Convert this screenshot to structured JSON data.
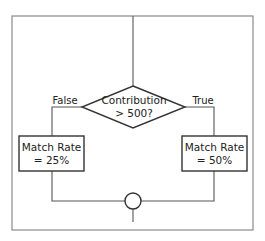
{
  "diagram": {
    "type": "flowchart",
    "decision": {
      "line1": "Contribution",
      "line2": "> 500?"
    },
    "branches": {
      "false_label": "False",
      "true_label": "True"
    },
    "false_action": {
      "line1": "Match Rate",
      "line2": "= 25%"
    },
    "true_action": {
      "line1": "Match Rate",
      "line2": "= 50%"
    },
    "merge_node": "connector-circle",
    "colors": {
      "frame": "#8a8a8a",
      "lines": "#555555",
      "shape_border": "#333333",
      "text": "#222222"
    }
  }
}
